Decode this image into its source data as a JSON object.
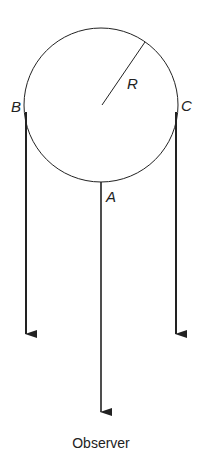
{
  "diagram": {
    "labels": {
      "radius": "R",
      "point_b": "B",
      "point_c": "C",
      "point_a": "A",
      "observer": "Observer"
    },
    "colors": {
      "stroke": "#222222",
      "background": "#ffffff"
    }
  }
}
